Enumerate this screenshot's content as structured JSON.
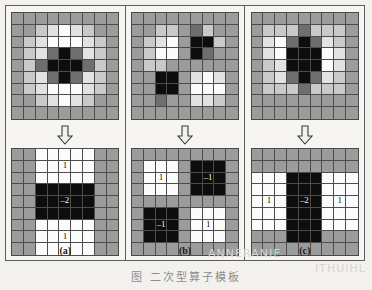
{
  "figure": {
    "caption": "图     二次型算子模板",
    "watermark_right": "ITHUIHL",
    "watermark_mid": "ANNERANIE"
  },
  "palette": {
    "black": "#0d0d0d",
    "dark": "#3c3c3c",
    "mid_dark": "#6e6e6e",
    "gray": "#9c9c9c",
    "light": "#c9c9c9",
    "lighter": "#e2e2e2",
    "white": "#fbfbfb",
    "frame_line": "#4c4c4c",
    "paper": "#f6f5f2"
  },
  "panels": [
    {
      "id": "a",
      "label": "(a)",
      "arrow_icon": "down-arrow-icon",
      "top_grid": {
        "rows": 9,
        "cols": 9,
        "shades": [
          [
            "gray",
            "gray",
            "gray",
            "gray",
            "gray",
            "gray",
            "gray",
            "gray",
            "gray"
          ],
          [
            "gray",
            "gray",
            "light",
            "lighter",
            "white",
            "lighter",
            "light",
            "gray",
            "gray"
          ],
          [
            "gray",
            "light",
            "lighter",
            "white",
            "white",
            "white",
            "lighter",
            "light",
            "gray"
          ],
          [
            "gray",
            "light",
            "lighter",
            "mid_dark",
            "black",
            "mid_dark",
            "lighter",
            "light",
            "gray"
          ],
          [
            "gray",
            "light",
            "mid_dark",
            "black",
            "black",
            "black",
            "mid_dark",
            "light",
            "gray"
          ],
          [
            "gray",
            "light",
            "lighter",
            "mid_dark",
            "black",
            "mid_dark",
            "lighter",
            "light",
            "gray"
          ],
          [
            "gray",
            "light",
            "lighter",
            "white",
            "white",
            "white",
            "lighter",
            "light",
            "gray"
          ],
          [
            "gray",
            "gray",
            "light",
            "lighter",
            "white",
            "lighter",
            "light",
            "gray",
            "gray"
          ],
          [
            "gray",
            "gray",
            "gray",
            "gray",
            "gray",
            "gray",
            "gray",
            "gray",
            "gray"
          ]
        ]
      },
      "bottom_grid": {
        "rows": 9,
        "cols": 9,
        "shades": [
          [
            "gray",
            "gray",
            "white",
            "white",
            "white",
            "white",
            "white",
            "gray",
            "gray"
          ],
          [
            "gray",
            "gray",
            "white",
            "white",
            "white",
            "white",
            "white",
            "gray",
            "gray"
          ],
          [
            "gray",
            "gray",
            "white",
            "white",
            "white",
            "white",
            "white",
            "gray",
            "gray"
          ],
          [
            "gray",
            "gray",
            "black",
            "black",
            "black",
            "black",
            "black",
            "gray",
            "gray"
          ],
          [
            "gray",
            "gray",
            "black",
            "black",
            "black",
            "black",
            "black",
            "gray",
            "gray"
          ],
          [
            "gray",
            "gray",
            "black",
            "black",
            "black",
            "black",
            "black",
            "gray",
            "gray"
          ],
          [
            "gray",
            "gray",
            "white",
            "white",
            "white",
            "white",
            "white",
            "gray",
            "gray"
          ],
          [
            "gray",
            "gray",
            "white",
            "white",
            "white",
            "white",
            "white",
            "gray",
            "gray"
          ],
          [
            "gray",
            "gray",
            "white",
            "white",
            "white",
            "white",
            "white",
            "gray",
            "gray"
          ]
        ],
        "labels": [
          {
            "row": 1,
            "col": 4,
            "text": "1"
          },
          {
            "row": 4,
            "col": 4,
            "text": "–2"
          },
          {
            "row": 7,
            "col": 4,
            "text": "1"
          }
        ]
      }
    },
    {
      "id": "b",
      "label": "(b)",
      "arrow_icon": "down-arrow-icon",
      "top_grid": {
        "rows": 9,
        "cols": 9,
        "shades": [
          [
            "gray",
            "gray",
            "gray",
            "gray",
            "gray",
            "gray",
            "gray",
            "gray",
            "gray"
          ],
          [
            "gray",
            "gray",
            "light",
            "light",
            "gray",
            "mid_dark",
            "light",
            "gray",
            "gray"
          ],
          [
            "gray",
            "light",
            "lighter",
            "white",
            "gray",
            "black",
            "black",
            "light",
            "gray"
          ],
          [
            "gray",
            "light",
            "white",
            "white",
            "gray",
            "black",
            "mid_dark",
            "gray",
            "gray"
          ],
          [
            "gray",
            "light",
            "light",
            "gray",
            "gray",
            "gray",
            "gray",
            "gray",
            "gray"
          ],
          [
            "gray",
            "gray",
            "black",
            "black",
            "gray",
            "lighter",
            "white",
            "lighter",
            "gray"
          ],
          [
            "gray",
            "gray",
            "black",
            "black",
            "gray",
            "white",
            "white",
            "white",
            "gray"
          ],
          [
            "gray",
            "gray",
            "mid_dark",
            "gray",
            "gray",
            "lighter",
            "lighter",
            "light",
            "gray"
          ],
          [
            "gray",
            "gray",
            "gray",
            "gray",
            "gray",
            "gray",
            "gray",
            "gray",
            "gray"
          ]
        ]
      },
      "bottom_grid": {
        "rows": 9,
        "cols": 9,
        "shades": [
          [
            "gray",
            "gray",
            "gray",
            "gray",
            "gray",
            "gray",
            "gray",
            "gray",
            "gray"
          ],
          [
            "gray",
            "white",
            "white",
            "white",
            "gray",
            "black",
            "black",
            "black",
            "gray"
          ],
          [
            "gray",
            "white",
            "white",
            "white",
            "gray",
            "black",
            "black",
            "black",
            "gray"
          ],
          [
            "gray",
            "white",
            "white",
            "white",
            "gray",
            "black",
            "black",
            "black",
            "gray"
          ],
          [
            "gray",
            "gray",
            "gray",
            "gray",
            "gray",
            "gray",
            "gray",
            "gray",
            "gray"
          ],
          [
            "gray",
            "black",
            "black",
            "black",
            "gray",
            "white",
            "white",
            "white",
            "gray"
          ],
          [
            "gray",
            "black",
            "black",
            "black",
            "gray",
            "white",
            "white",
            "white",
            "gray"
          ],
          [
            "gray",
            "black",
            "black",
            "black",
            "gray",
            "white",
            "white",
            "white",
            "gray"
          ],
          [
            "gray",
            "gray",
            "gray",
            "gray",
            "gray",
            "gray",
            "gray",
            "gray",
            "gray"
          ]
        ],
        "labels": [
          {
            "row": 2,
            "col": 2,
            "text": "1"
          },
          {
            "row": 2,
            "col": 6,
            "text": "–1"
          },
          {
            "row": 6,
            "col": 2,
            "text": "–1"
          },
          {
            "row": 6,
            "col": 6,
            "text": "1"
          }
        ]
      }
    },
    {
      "id": "c",
      "label": "(c)",
      "arrow_icon": "down-arrow-icon",
      "top_grid": {
        "rows": 9,
        "cols": 9,
        "shades": [
          [
            "gray",
            "gray",
            "gray",
            "gray",
            "gray",
            "gray",
            "gray",
            "gray",
            "gray"
          ],
          [
            "gray",
            "light",
            "light",
            "light",
            "mid_dark",
            "light",
            "light",
            "light",
            "gray"
          ],
          [
            "gray",
            "lighter",
            "white",
            "mid_dark",
            "black",
            "mid_dark",
            "lighter",
            "light",
            "gray"
          ],
          [
            "gray",
            "lighter",
            "white",
            "black",
            "black",
            "black",
            "white",
            "lighter",
            "gray"
          ],
          [
            "gray",
            "light",
            "lighter",
            "black",
            "black",
            "black",
            "white",
            "lighter",
            "gray"
          ],
          [
            "gray",
            "light",
            "lighter",
            "mid_dark",
            "black",
            "mid_dark",
            "lighter",
            "light",
            "gray"
          ],
          [
            "gray",
            "light",
            "light",
            "light",
            "mid_dark",
            "light",
            "light",
            "light",
            "gray"
          ],
          [
            "gray",
            "gray",
            "gray",
            "gray",
            "gray",
            "gray",
            "gray",
            "gray",
            "gray"
          ],
          [
            "gray",
            "gray",
            "gray",
            "gray",
            "gray",
            "gray",
            "gray",
            "gray",
            "gray"
          ]
        ]
      },
      "bottom_grid": {
        "rows": 9,
        "cols": 9,
        "shades": [
          [
            "gray",
            "gray",
            "gray",
            "gray",
            "gray",
            "gray",
            "gray",
            "gray",
            "gray"
          ],
          [
            "gray",
            "gray",
            "gray",
            "gray",
            "gray",
            "gray",
            "gray",
            "gray",
            "gray"
          ],
          [
            "white",
            "white",
            "white",
            "black",
            "black",
            "black",
            "white",
            "white",
            "white"
          ],
          [
            "white",
            "white",
            "white",
            "black",
            "black",
            "black",
            "white",
            "white",
            "white"
          ],
          [
            "white",
            "white",
            "white",
            "black",
            "black",
            "black",
            "white",
            "white",
            "white"
          ],
          [
            "white",
            "white",
            "white",
            "black",
            "black",
            "black",
            "white",
            "white",
            "white"
          ],
          [
            "white",
            "white",
            "white",
            "black",
            "black",
            "black",
            "white",
            "white",
            "white"
          ],
          [
            "gray",
            "gray",
            "gray",
            "black",
            "black",
            "black",
            "gray",
            "gray",
            "gray"
          ],
          [
            "gray",
            "gray",
            "gray",
            "gray",
            "gray",
            "gray",
            "gray",
            "gray",
            "gray"
          ]
        ],
        "labels": [
          {
            "row": 4,
            "col": 1,
            "text": "1"
          },
          {
            "row": 4,
            "col": 4,
            "text": "–2"
          },
          {
            "row": 4,
            "col": 7,
            "text": "1"
          }
        ]
      }
    }
  ]
}
